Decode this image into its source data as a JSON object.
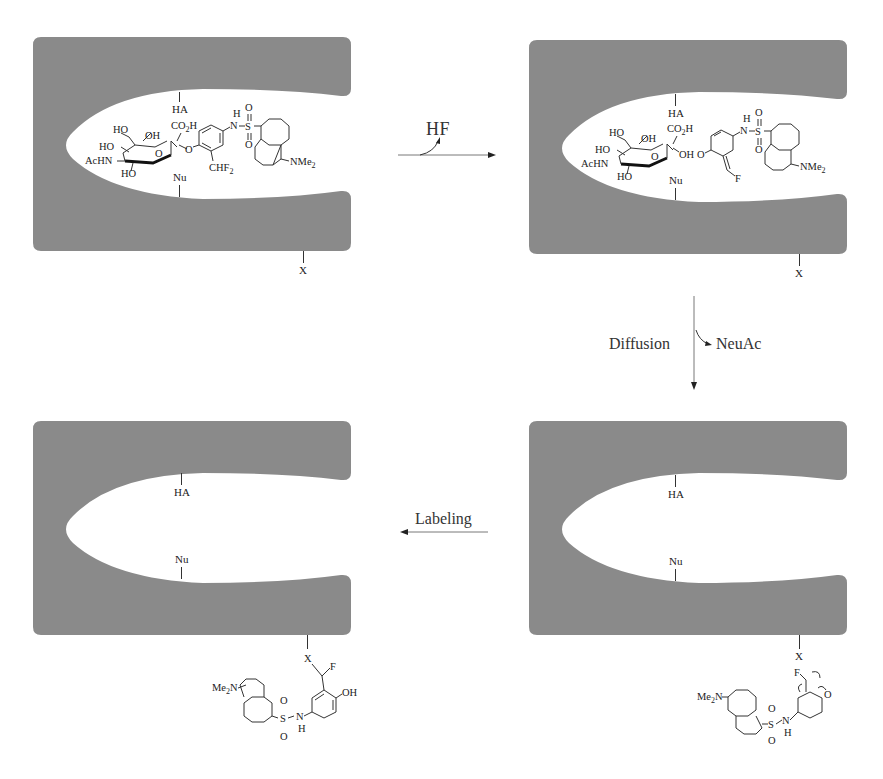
{
  "figure": {
    "type": "reaction-mechanism-diagram",
    "colors": {
      "enzyme": "#8a8a8a",
      "cavity": "#ffffff",
      "text": "#222222",
      "arrow": "#333333"
    }
  },
  "panels": [
    {
      "id": "panel-1",
      "position": "top-left",
      "site_labels": {
        "acid": "HA",
        "nucleophile": "Nu",
        "surface_residue": "X"
      },
      "bound_ligand": {
        "name": "substrate",
        "labels": [
          "HO",
          "OH",
          "HO",
          "AcHN",
          "HO",
          "O",
          "CO2H",
          "O",
          "CHF2",
          "H",
          "N",
          "S",
          "O",
          "O",
          "NMe2"
        ]
      }
    },
    {
      "id": "panel-2",
      "position": "top-right",
      "site_labels": {
        "acid": "HA",
        "nucleophile": "Nu",
        "surface_residue": "X"
      },
      "bound_ligand": {
        "name": "quinone-methide-intermediate",
        "labels": [
          "HO",
          "OH",
          "HO",
          "AcHN",
          "HO",
          "O",
          "CO2H",
          "OH",
          "O",
          "F",
          "H",
          "N",
          "S",
          "O",
          "O",
          "NMe2"
        ]
      }
    },
    {
      "id": "panel-3",
      "position": "bottom-right",
      "site_labels": {
        "acid": "HA",
        "nucleophile": "Nu",
        "surface_residue": "X"
      },
      "free_ligand": {
        "name": "released-quinone-methide",
        "labels": [
          "F",
          "O",
          "Me2N",
          "S",
          "O",
          "O",
          "N",
          "H"
        ]
      }
    },
    {
      "id": "panel-4",
      "position": "bottom-left",
      "site_labels": {
        "acid": "HA",
        "nucleophile": "Nu",
        "surface_residue": "X"
      },
      "attached_ligand": {
        "name": "labeled-enzyme-adduct",
        "labels": [
          "X",
          "F",
          "OH",
          "Me2N",
          "S",
          "O",
          "O",
          "N",
          "H"
        ]
      }
    }
  ],
  "arrows": [
    {
      "id": "step-1",
      "from": "panel-1",
      "to": "panel-2",
      "direction": "right",
      "label": "HF",
      "label_role": "released"
    },
    {
      "id": "step-2",
      "from": "panel-2",
      "to": "panel-3",
      "direction": "down",
      "label_left": "Diffusion",
      "label_right": "NeuAc",
      "label_right_role": "released"
    },
    {
      "id": "step-3",
      "from": "panel-3",
      "to": "panel-4",
      "direction": "left",
      "label": "Labeling"
    }
  ]
}
